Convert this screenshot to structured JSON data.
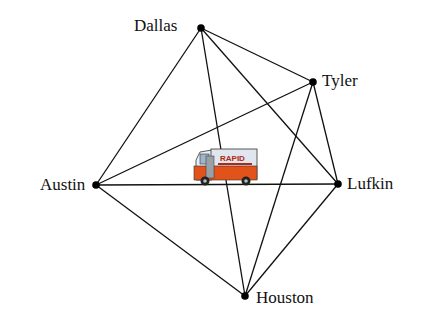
{
  "diagram": {
    "type": "complete-graph",
    "nodes": [
      {
        "id": "dallas",
        "label": "Dallas",
        "x": 201,
        "y": 28,
        "label_x": 134,
        "label_y": 17
      },
      {
        "id": "tyler",
        "label": "Tyler",
        "x": 313,
        "y": 82,
        "label_x": 322,
        "label_y": 72
      },
      {
        "id": "austin",
        "label": "Austin",
        "x": 96,
        "y": 185,
        "label_x": 40,
        "label_y": 176
      },
      {
        "id": "lufkin",
        "label": "Lufkin",
        "x": 338,
        "y": 184,
        "label_x": 347,
        "label_y": 175
      },
      {
        "id": "houston",
        "label": "Houston",
        "x": 245,
        "y": 296,
        "label_x": 256,
        "label_y": 289
      }
    ],
    "edges": [
      [
        "dallas",
        "tyler"
      ],
      [
        "dallas",
        "austin"
      ],
      [
        "dallas",
        "lufkin"
      ],
      [
        "dallas",
        "houston"
      ],
      [
        "tyler",
        "austin"
      ],
      [
        "tyler",
        "lufkin"
      ],
      [
        "tyler",
        "houston"
      ],
      [
        "austin",
        "lufkin"
      ],
      [
        "austin",
        "houston"
      ],
      [
        "lufkin",
        "houston"
      ]
    ],
    "center_image": {
      "name": "delivery-truck",
      "text": "RAPID"
    }
  }
}
